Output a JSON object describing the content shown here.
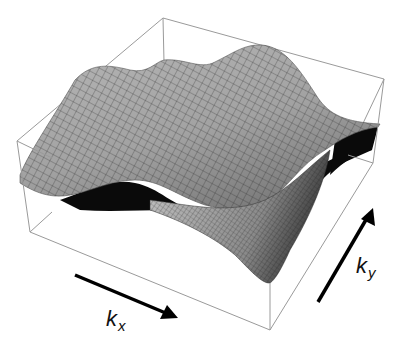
{
  "figure": {
    "type": "3d-surface-plot",
    "colors": {
      "background": "#ffffff",
      "box_edges": "#9a9a9a",
      "surface_fill": "#a8a8a8",
      "surface_shadow": "#0a0a0a",
      "mesh_lines": "#2a2a2a",
      "arrows": "#000000"
    },
    "axes": {
      "x": {
        "label_main": "k",
        "label_sub": "x",
        "arrow_direction": "down-right"
      },
      "y": {
        "label_main": "k",
        "label_sub": "y",
        "arrow_direction": "up-right"
      }
    }
  }
}
